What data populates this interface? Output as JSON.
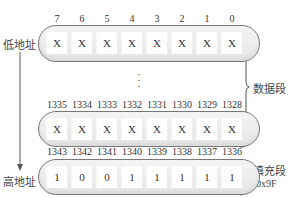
{
  "labels": {
    "low_address": "低地址",
    "high_address": "高地址",
    "data_segment": "数据段",
    "padding_segment": "填充段",
    "padding_value": "0x9F",
    "ellipsis": "⋮"
  },
  "rows": [
    {
      "indices": [
        "7",
        "6",
        "5",
        "4",
        "3",
        "2",
        "1",
        "0"
      ],
      "cells": [
        "X",
        "X",
        "X",
        "X",
        "X",
        "X",
        "X",
        "X"
      ]
    },
    {
      "indices": [
        "1335",
        "1334",
        "1333",
        "1332",
        "1331",
        "1330",
        "1329",
        "1328"
      ],
      "cells": [
        "X",
        "X",
        "X",
        "X",
        "X",
        "X",
        "X",
        "X"
      ]
    },
    {
      "indices": [
        "1343",
        "1342",
        "1341",
        "1340",
        "1339",
        "1338",
        "1337",
        "1336"
      ],
      "cells": [
        "1",
        "0",
        "0",
        "1",
        "1",
        "1",
        "1",
        "1"
      ]
    }
  ],
  "colors": {
    "pill_border": "#777777",
    "pill_fill": "#ececec",
    "line": "#555555",
    "text": "#333333"
  }
}
